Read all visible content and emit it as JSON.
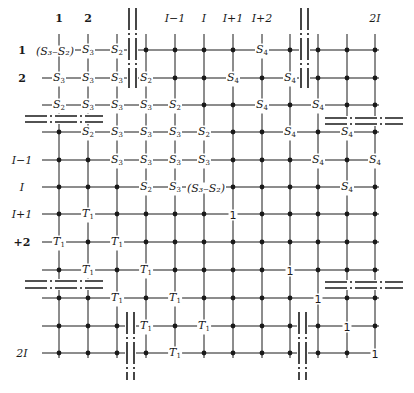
{
  "diagram": {
    "column_labels": [
      "1",
      "2",
      "I-1",
      "I",
      "I+1",
      "I+2",
      "2I"
    ],
    "row_labels": [
      "1",
      "2",
      "I-1",
      "I",
      "I+1",
      "+2",
      "2I"
    ],
    "columns_x": [
      59,
      88,
      117,
      146,
      175,
      204,
      233,
      262,
      290,
      318,
      347,
      375
    ],
    "rows_y": [
      50,
      78,
      105,
      132,
      160,
      187,
      214,
      242,
      270,
      298,
      326,
      353
    ],
    "column_label_positions": [
      {
        "text": "1",
        "col": 0,
        "style": "bold"
      },
      {
        "text": "2",
        "col": 1,
        "style": "bold"
      },
      {
        "text": "I−1",
        "col": 4,
        "style": "italic"
      },
      {
        "text": "I",
        "col": 5,
        "style": "italic"
      },
      {
        "text": "I+1",
        "col": 6,
        "style": "italic"
      },
      {
        "text": "I+2",
        "col": 7,
        "style": "italic"
      },
      {
        "text": "2I",
        "col": 11,
        "style": "italic"
      }
    ],
    "row_label_positions": [
      {
        "text": "1",
        "row": 0,
        "style": "bold"
      },
      {
        "text": "2",
        "row": 1,
        "style": "bold"
      },
      {
        "text": "I−1",
        "row": 4,
        "style": "italic"
      },
      {
        "text": "I",
        "row": 5,
        "style": "italic"
      },
      {
        "text": "I+1",
        "row": 6,
        "style": "italic"
      },
      {
        "text": "+2",
        "row": 7,
        "style": "bold"
      },
      {
        "text": "2I",
        "row": 11,
        "style": "italic"
      }
    ],
    "cells": [
      [
        "(S3-S2)",
        "S3",
        "S2",
        "D",
        "D",
        "D",
        "D",
        "S4",
        "D",
        "D",
        "D",
        "D"
      ],
      [
        "S3",
        "S3",
        "S3",
        "S2",
        "D",
        "D",
        "S4",
        "D",
        "S4",
        "D",
        "D",
        "D"
      ],
      [
        "S2",
        "S3",
        "S3",
        "S3",
        "S2",
        "D",
        "D",
        "S4",
        "D",
        "S4",
        "D",
        "D"
      ],
      [
        "D",
        "S2",
        "S3",
        "S3",
        "S3",
        "S2",
        "D",
        "D",
        "S4",
        "D",
        "S4",
        "D"
      ],
      [
        "D",
        "D",
        "S3",
        "S3",
        "S3",
        "S3",
        "D",
        "D",
        "D",
        "S4",
        "D",
        "S4"
      ],
      [
        "D",
        "D",
        "D",
        "S2",
        "S3",
        "(S3-S2)",
        "D",
        "D",
        "D",
        "D",
        "S4",
        "D"
      ],
      [
        "D",
        "T1",
        "D",
        "D",
        "D",
        "D",
        "1",
        "D",
        "D",
        "D",
        "D",
        "D"
      ],
      [
        "T1",
        "D",
        "T1",
        "D",
        "D",
        "D",
        "D",
        "D",
        "D",
        "D",
        "D",
        "D"
      ],
      [
        "D",
        "T1",
        "D",
        "T1",
        "D",
        "D",
        "D",
        "D",
        "1",
        "D",
        "D",
        "D"
      ],
      [
        "D",
        "D",
        "T1",
        "D",
        "T1",
        "D",
        "D",
        "D",
        "D",
        "1",
        "D",
        "D"
      ],
      [
        "D",
        "D",
        "D",
        "T1",
        "D",
        "T1",
        "D",
        "D",
        "D",
        "D",
        "1",
        "D"
      ],
      [
        "D",
        "D",
        "D",
        "D",
        "T1",
        "D",
        "D",
        "D",
        "D",
        "D",
        "D",
        "1"
      ]
    ],
    "symbols": {
      "S2": {
        "base": "S",
        "sub": "2"
      },
      "S3": {
        "base": "S",
        "sub": "3"
      },
      "S4": {
        "base": "S",
        "sub": "4"
      },
      "T1": {
        "base": "T",
        "sub": "1"
      },
      "(S3-S2)": {
        "text": "(S₃–S₂)"
      },
      "1": {
        "text": "1"
      }
    },
    "breaks": {
      "vertical": [
        {
          "x": [
            129,
            136
          ],
          "y": [
            8,
            88
          ]
        },
        {
          "x": [
            301,
            308
          ],
          "y": [
            8,
            88
          ]
        },
        {
          "x": [
            127,
            134
          ],
          "y": [
            312,
            380
          ]
        },
        {
          "x": [
            299,
            306
          ],
          "y": [
            312,
            380
          ]
        }
      ],
      "horizontal": [
        {
          "y": [
            116,
            122
          ],
          "x": [
            25,
            103
          ]
        },
        {
          "y": [
            118,
            124
          ],
          "x": [
            325,
            403
          ]
        },
        {
          "y": [
            281,
            288
          ],
          "x": [
            25,
            103
          ]
        },
        {
          "y": [
            282,
            288
          ],
          "x": [
            325,
            403
          ]
        }
      ]
    },
    "colors": {
      "ink": "#1a1a1a",
      "paper": "#ffffff"
    }
  }
}
